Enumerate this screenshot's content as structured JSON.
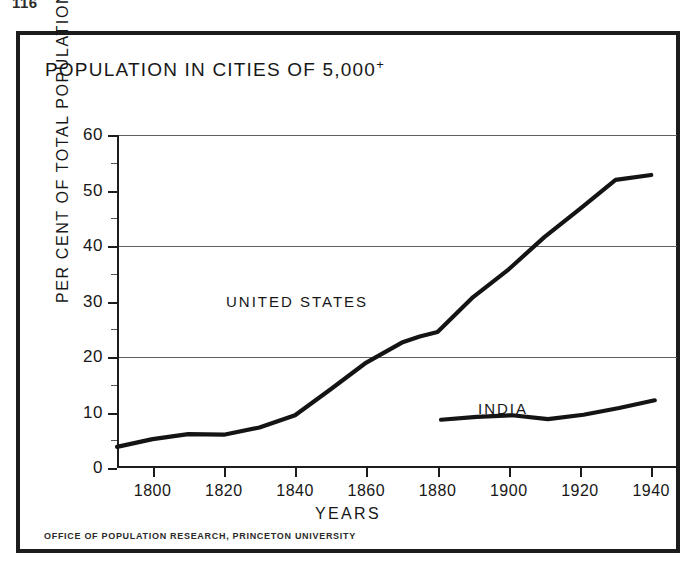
{
  "page_number": "116",
  "figure": {
    "title": "POPULATION IN CITIES OF 5,000",
    "title_superscript": "+",
    "credit": "OFFICE OF POPULATION RESEARCH, PRINCETON UNIVERSITY"
  },
  "chart_data": {
    "type": "line",
    "title": "POPULATION IN CITIES OF 5,000+",
    "xlabel": "YEARS",
    "ylabel": "PER CENT OF TOTAL POPULATION",
    "xlim": [
      1790,
      1945
    ],
    "ylim": [
      0,
      60
    ],
    "xticks": [
      1800,
      1820,
      1840,
      1860,
      1880,
      1900,
      1920,
      1940
    ],
    "xtick_labels": [
      "1800",
      "1820",
      "1840",
      "1860",
      "1880",
      "1900",
      "1920",
      "1940"
    ],
    "yticks": [
      0,
      10,
      20,
      30,
      40,
      50,
      60
    ],
    "ytick_labels": [
      "0",
      "10",
      "20",
      "30",
      "40",
      "50",
      "60"
    ],
    "gridlines_y": [
      20,
      40,
      60
    ],
    "grid": true,
    "legend": "inline-labels",
    "series": [
      {
        "name": "UNITED STATES",
        "label_position": {
          "x": 1825,
          "y": 27.5
        },
        "x": [
          1790,
          1800,
          1810,
          1820,
          1830,
          1840,
          1850,
          1860,
          1870,
          1875,
          1880,
          1890,
          1900,
          1910,
          1920,
          1930,
          1940
        ],
        "values": [
          3.8,
          5.2,
          6.1,
          6.0,
          7.3,
          9.5,
          14.2,
          19.0,
          22.6,
          23.7,
          24.5,
          30.8,
          35.8,
          41.6,
          46.7,
          51.9,
          52.8
        ]
      },
      {
        "name": "INDIA",
        "label_position": {
          "x": 1896,
          "y": 14.2
        },
        "x": [
          1881,
          1891,
          1901,
          1911,
          1921,
          1931,
          1941
        ],
        "values": [
          8.7,
          9.2,
          9.5,
          8.8,
          9.6,
          10.8,
          12.2
        ]
      }
    ]
  }
}
